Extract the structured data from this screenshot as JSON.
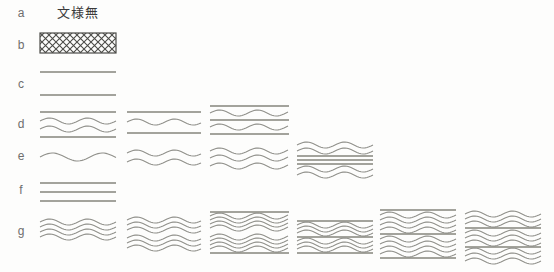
{
  "figure": {
    "title": "文様無",
    "background": "#fdfdfc",
    "colors": {
      "wave": "#90908a",
      "straight": "#84847c",
      "hatch": "#4c4c48",
      "label": "#6e6e6e",
      "title": "#3a3a3a"
    },
    "wave_default": {
      "amplitude": 3,
      "wavelength": 38
    },
    "rows": [
      {
        "label": "a",
        "cells": []
      },
      {
        "label": "b",
        "cells": [
          {
            "id": "b1",
            "type": "crosshatch",
            "x": 40,
            "y": 33,
            "width": 76,
            "height": 20
          }
        ]
      },
      {
        "label": "c",
        "cells": [
          {
            "id": "c1",
            "type": "lines",
            "x": 40,
            "width": 76,
            "lines": [
              {
                "kind": "straight",
                "y": 72
              },
              {
                "kind": "straight",
                "y": 95
              }
            ]
          }
        ]
      },
      {
        "label": "d",
        "cells": [
          {
            "id": "d1",
            "type": "lines",
            "x": 40,
            "width": 76,
            "lines": [
              {
                "kind": "straight",
                "y": 112
              },
              {
                "kind": "wave",
                "y": 121
              },
              {
                "kind": "wave",
                "y": 129
              },
              {
                "kind": "straight",
                "y": 137
              }
            ]
          },
          {
            "id": "d2",
            "type": "lines",
            "x": 127,
            "width": 74,
            "lines": [
              {
                "kind": "straight",
                "y": 112
              },
              {
                "kind": "wave",
                "y": 122
              },
              {
                "kind": "straight",
                "y": 133
              }
            ]
          },
          {
            "id": "d3",
            "type": "lines",
            "x": 210,
            "width": 79,
            "lines": [
              {
                "kind": "straight",
                "y": 106
              },
              {
                "kind": "wave",
                "y": 113
              },
              {
                "kind": "straight",
                "y": 120
              },
              {
                "kind": "wave",
                "y": 127
              },
              {
                "kind": "straight",
                "y": 134
              }
            ]
          }
        ]
      },
      {
        "label": "e",
        "cells": [
          {
            "id": "e1",
            "type": "lines",
            "x": 40,
            "width": 76,
            "lines": [
              {
                "kind": "wave",
                "y": 157,
                "amplitude": 4,
                "wavelength": 50
              }
            ]
          },
          {
            "id": "e2",
            "type": "lines",
            "x": 127,
            "width": 74,
            "lines": [
              {
                "kind": "wave",
                "y": 153
              },
              {
                "kind": "wave",
                "y": 162
              }
            ]
          },
          {
            "id": "e3",
            "type": "lines",
            "x": 210,
            "width": 79,
            "lines": [
              {
                "kind": "wave",
                "y": 151
              },
              {
                "kind": "wave",
                "y": 158
              },
              {
                "kind": "wave",
                "y": 166
              }
            ]
          },
          {
            "id": "e4",
            "type": "lines",
            "x": 297,
            "width": 76,
            "lines": [
              {
                "kind": "wave",
                "y": 145
              },
              {
                "kind": "wave",
                "y": 151
              },
              {
                "kind": "straight",
                "y": 156
              },
              {
                "kind": "straight",
                "y": 160
              },
              {
                "kind": "straight",
                "y": 164
              },
              {
                "kind": "wave",
                "y": 169
              },
              {
                "kind": "wave",
                "y": 175
              }
            ]
          }
        ]
      },
      {
        "label": "f",
        "cells": [
          {
            "id": "f1",
            "type": "lines",
            "x": 40,
            "width": 76,
            "lines": [
              {
                "kind": "straight",
                "y": 183
              },
              {
                "kind": "straight",
                "y": 192
              },
              {
                "kind": "straight",
                "y": 201
              }
            ]
          }
        ]
      },
      {
        "label": "g",
        "cells": [
          {
            "id": "g1",
            "type": "lines",
            "x": 40,
            "width": 76,
            "lines": [
              {
                "kind": "wave",
                "y": 222
              },
              {
                "kind": "wave",
                "y": 227
              },
              {
                "kind": "wave",
                "y": 232
              },
              {
                "kind": "wave",
                "y": 237
              }
            ]
          },
          {
            "id": "g2",
            "type": "lines",
            "x": 127,
            "width": 74,
            "lines": [
              {
                "kind": "wave",
                "y": 220
              },
              {
                "kind": "wave",
                "y": 225
              },
              {
                "kind": "wave",
                "y": 230
              },
              {
                "kind": "wave",
                "y": 238
              },
              {
                "kind": "wave",
                "y": 243
              },
              {
                "kind": "wave",
                "y": 248
              }
            ]
          },
          {
            "id": "g3",
            "type": "lines",
            "x": 210,
            "width": 79,
            "lines": [
              {
                "kind": "straight",
                "y": 212
              },
              {
                "kind": "wave",
                "y": 216
              },
              {
                "kind": "wave",
                "y": 220
              },
              {
                "kind": "wave",
                "y": 224
              },
              {
                "kind": "wave",
                "y": 228
              },
              {
                "kind": "wave",
                "y": 237
              },
              {
                "kind": "wave",
                "y": 241
              },
              {
                "kind": "wave",
                "y": 245
              },
              {
                "kind": "wave",
                "y": 249
              },
              {
                "kind": "straight",
                "y": 253
              }
            ]
          },
          {
            "id": "g4",
            "type": "lines",
            "x": 297,
            "width": 76,
            "lines": [
              {
                "kind": "straight",
                "y": 221
              },
              {
                "kind": "wave",
                "y": 225
              },
              {
                "kind": "wave",
                "y": 229
              },
              {
                "kind": "wave",
                "y": 233
              },
              {
                "kind": "straight",
                "y": 237
              },
              {
                "kind": "wave",
                "y": 241
              },
              {
                "kind": "wave",
                "y": 245
              },
              {
                "kind": "wave",
                "y": 249
              },
              {
                "kind": "straight",
                "y": 253
              }
            ]
          },
          {
            "id": "g5",
            "type": "lines",
            "x": 380,
            "width": 76,
            "lines": [
              {
                "kind": "straight",
                "y": 210
              },
              {
                "kind": "wave",
                "y": 215
              },
              {
                "kind": "wave",
                "y": 220
              },
              {
                "kind": "wave",
                "y": 225
              },
              {
                "kind": "wave",
                "y": 230
              },
              {
                "kind": "straight",
                "y": 234
              },
              {
                "kind": "wave",
                "y": 239
              },
              {
                "kind": "wave",
                "y": 244
              },
              {
                "kind": "wave",
                "y": 249
              },
              {
                "kind": "wave",
                "y": 254
              },
              {
                "kind": "straight",
                "y": 258
              }
            ]
          },
          {
            "id": "g6",
            "type": "lines",
            "x": 465,
            "width": 76,
            "lines": [
              {
                "kind": "wave",
                "y": 214
              },
              {
                "kind": "wave",
                "y": 219
              },
              {
                "kind": "wave",
                "y": 224
              },
              {
                "kind": "straight",
                "y": 228
              },
              {
                "kind": "wave",
                "y": 233
              },
              {
                "kind": "wave",
                "y": 238
              },
              {
                "kind": "wave",
                "y": 243
              },
              {
                "kind": "straight",
                "y": 247
              },
              {
                "kind": "wave",
                "y": 251
              },
              {
                "kind": "wave",
                "y": 256
              },
              {
                "kind": "wave",
                "y": 261
              }
            ]
          }
        ]
      }
    ]
  }
}
